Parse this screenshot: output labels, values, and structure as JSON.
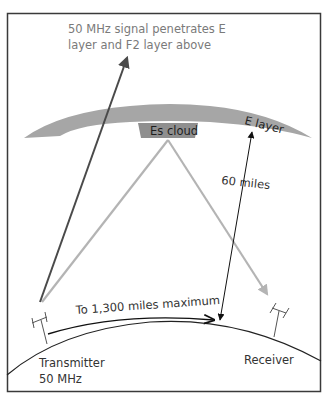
{
  "diagram": {
    "title_annotation": {
      "line1": "50 MHz signal penetrates E",
      "line2": "layer and F2 layer above"
    },
    "labels": {
      "es_cloud": "Es cloud",
      "e_layer": "E layer",
      "height": "60 miles",
      "distance": "To 1,300 miles maximum",
      "transmitter_line1": "Transmitter",
      "transmitter_line2": "50 MHz",
      "receiver": "Receiver"
    },
    "colors": {
      "frame": "#3a3a3a",
      "e_layer_fill": "#a6a6a6",
      "es_cloud_fill": "#8f8f8f",
      "penetrating_ray": "#4a4a4a",
      "reflected_ray": "#b4b4b4",
      "earth_line": "#222222",
      "annotation_text": "#7a7a7a"
    },
    "components": [
      "frame",
      "e-layer",
      "es-cloud",
      "penetrating-ray",
      "reflected-ray-up",
      "reflected-ray-down",
      "height-arrow",
      "distance-arrow",
      "earth-surface",
      "transmitter-antenna",
      "receiver-antenna"
    ]
  }
}
